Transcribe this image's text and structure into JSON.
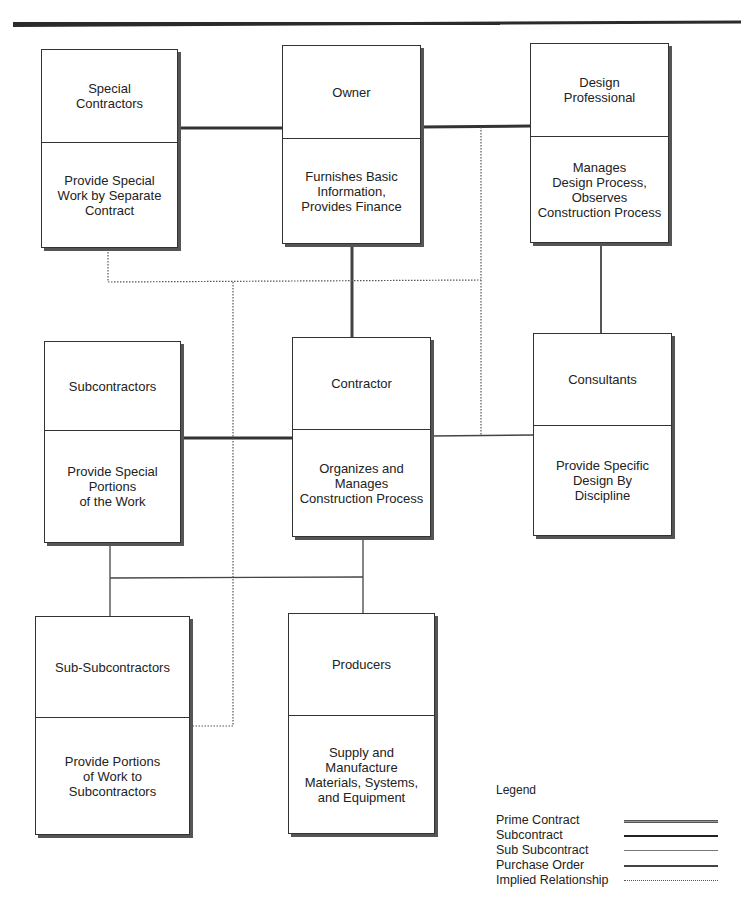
{
  "diagram": {
    "type": "organizational relationship diagram",
    "boxes": [
      {
        "id": "special-contractors",
        "title": "Special\nContractors",
        "description": "Provide Special\nWork by Separate\nContract"
      },
      {
        "id": "owner",
        "title": "Owner",
        "description": "Furnishes Basic\nInformation,\nProvides Finance"
      },
      {
        "id": "design-professional",
        "title": "Design\nProfessional",
        "description": "Manages\nDesign Process,\nObserves\nConstruction Process"
      },
      {
        "id": "subcontractors",
        "title": "Subcontractors",
        "description": "Provide Special\nPortions\nof the Work"
      },
      {
        "id": "contractor",
        "title": "Contractor",
        "description": "Organizes and\nManages\nConstruction Process"
      },
      {
        "id": "consultants",
        "title": "Consultants",
        "description": "Provide Specific\nDesign By\nDiscipline"
      },
      {
        "id": "sub-subcontractors",
        "title": "Sub-Subcontractors",
        "description": "Provide Portions\nof Work to\nSubcontractors"
      },
      {
        "id": "producers",
        "title": "Producers",
        "description": "Supply and\nManufacture\nMaterials, Systems,\nand Equipment"
      }
    ],
    "connections": [
      {
        "from": "special-contractors",
        "to": "owner",
        "type": "Prime Contract"
      },
      {
        "from": "owner",
        "to": "design-professional",
        "type": "Prime Contract"
      },
      {
        "from": "owner",
        "to": "contractor",
        "type": "Prime Contract"
      },
      {
        "from": "design-professional",
        "to": "consultants",
        "type": "Subcontract"
      },
      {
        "from": "contractor",
        "to": "subcontractors",
        "type": "Subcontract"
      },
      {
        "from": "contractor",
        "to": "consultants",
        "type": "Implied Relationship"
      },
      {
        "from": "subcontractors",
        "to": "sub-subcontractors",
        "type": "Sub Subcontract"
      },
      {
        "from": "contractor",
        "to": "producers",
        "type": "Purchase Order"
      },
      {
        "from": "special-contractors",
        "to": "sub-subcontractors",
        "type": "Implied Relationship"
      },
      {
        "from": "design-professional",
        "to": "contractor",
        "type": "Implied Relationship"
      }
    ]
  },
  "legend": {
    "title": "Legend",
    "items": [
      {
        "label": "Prime Contract",
        "style": "double"
      },
      {
        "label": "Subcontract",
        "style": "thick"
      },
      {
        "label": "Sub Subcontract",
        "style": "thin"
      },
      {
        "label": "Purchase Order",
        "style": "medium"
      },
      {
        "label": "Implied Relationship",
        "style": "dotted"
      }
    ]
  },
  "colors": {
    "line": "#333333",
    "background": "#ffffff"
  }
}
